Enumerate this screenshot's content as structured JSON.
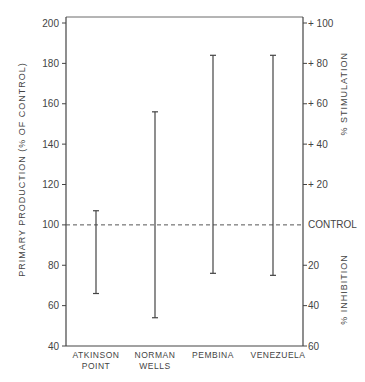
{
  "chart_data": {
    "type": "range-bar",
    "title": "",
    "xlabel": "",
    "ylabel": "PRIMARY PRODUCTION (% OF CONTROL)",
    "ylim": [
      40,
      200
    ],
    "yticks": [
      40,
      60,
      80,
      100,
      120,
      140,
      160,
      180,
      200
    ],
    "right_axis": {
      "upper_label": "% STIMULATION",
      "lower_label": "% INHIBITION",
      "ticks": [
        {
          "value": 200,
          "label": "+ 100"
        },
        {
          "value": 180,
          "label": "+ 80"
        },
        {
          "value": 160,
          "label": "+ 60"
        },
        {
          "value": 140,
          "label": "+ 40"
        },
        {
          "value": 120,
          "label": "+ 20"
        },
        {
          "value": 100,
          "label": "CONTROL"
        },
        {
          "value": 80,
          "label": "20"
        },
        {
          "value": 60,
          "label": "40"
        },
        {
          "value": 40,
          "label": "60"
        }
      ]
    },
    "control_line": 100,
    "grid": false,
    "categories": [
      {
        "line1": "ATKINSON",
        "line2": "POINT"
      },
      {
        "line1": "NORMAN",
        "line2": "WELLS"
      },
      {
        "line1": "PEMBINA",
        "line2": ""
      },
      {
        "line1": "VENEZUELA",
        "line2": ""
      }
    ],
    "series": [
      {
        "name": "range",
        "min": [
          66,
          54,
          76,
          75
        ],
        "max": [
          107,
          156,
          184,
          184
        ]
      }
    ]
  }
}
